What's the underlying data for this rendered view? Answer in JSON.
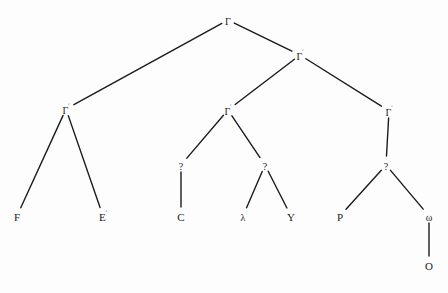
{
  "figure": {
    "type": "syntax-tree-diagram",
    "background_color": "#fdfdfd",
    "line_color": "#1b1b1b",
    "text_color": "#1b1b1b"
  },
  "nodes": [
    {
      "id": "n0",
      "label": "Γ",
      "sup": "",
      "x": 228,
      "y": 20,
      "name": "node-root-gamma"
    },
    {
      "id": "n1",
      "label": "Γ",
      "sup": "ʹ",
      "x": 300,
      "y": 55,
      "name": "node-gamma-prime"
    },
    {
      "id": "n2",
      "label": "Γ",
      "sup": "ʹ",
      "x": 66,
      "y": 109,
      "name": "node-gamma-left"
    },
    {
      "id": "n3",
      "label": "Γ",
      "sup": "ʹ",
      "x": 228,
      "y": 110,
      "name": "node-gamma-mid"
    },
    {
      "id": "n4",
      "label": "Γ",
      "sup": "ʹ",
      "x": 389,
      "y": 111,
      "name": "node-gamma-right"
    },
    {
      "id": "n5",
      "label": "F",
      "sup": "",
      "x": 17,
      "y": 216,
      "name": "node-leaf-f"
    },
    {
      "id": "n6",
      "label": "E",
      "sup": "ʹ",
      "x": 103,
      "y": 216,
      "name": "node-leaf-e"
    },
    {
      "id": "n7",
      "label": "?",
      "sup": "",
      "x": 181,
      "y": 165,
      "name": "node-question-left"
    },
    {
      "id": "n8",
      "label": "C",
      "sup": "",
      "x": 181,
      "y": 216,
      "name": "node-leaf-c"
    },
    {
      "id": "n9",
      "label": "?",
      "sup": "",
      "x": 265,
      "y": 165,
      "name": "node-question-mid"
    },
    {
      "id": "n10",
      "label": "λ",
      "sup": "",
      "x": 243,
      "y": 216,
      "name": "node-leaf-lambda"
    },
    {
      "id": "n11",
      "label": "Y",
      "sup": "",
      "x": 291,
      "y": 216,
      "name": "node-leaf-y"
    },
    {
      "id": "n12",
      "label": "?",
      "sup": "",
      "x": 386,
      "y": 165,
      "name": "node-question-right"
    },
    {
      "id": "n13",
      "label": "P",
      "sup": "",
      "x": 340,
      "y": 216,
      "name": "node-leaf-p"
    },
    {
      "id": "n14",
      "label": "ω",
      "sup": "",
      "x": 429,
      "y": 216,
      "name": "node-leaf-omega"
    },
    {
      "id": "n15",
      "label": "O",
      "sup": "",
      "x": 429,
      "y": 265,
      "name": "node-leaf-o"
    }
  ],
  "edges": [
    {
      "from": "n0",
      "to": "n2",
      "name": "edge-root-to-gamma-left"
    },
    {
      "from": "n0",
      "to": "n1",
      "name": "edge-root-to-gamma-prime"
    },
    {
      "from": "n1",
      "to": "n3",
      "name": "edge-gamma-prime-to-gamma-mid"
    },
    {
      "from": "n1",
      "to": "n4",
      "name": "edge-gamma-prime-to-gamma-right"
    },
    {
      "from": "n2",
      "to": "n5",
      "name": "edge-gamma-left-to-f"
    },
    {
      "from": "n2",
      "to": "n6",
      "name": "edge-gamma-left-to-e"
    },
    {
      "from": "n3",
      "to": "n7",
      "name": "edge-gamma-mid-to-question-left"
    },
    {
      "from": "n3",
      "to": "n9",
      "name": "edge-gamma-mid-to-question-mid"
    },
    {
      "from": "n7",
      "to": "n8",
      "name": "edge-question-left-to-c"
    },
    {
      "from": "n9",
      "to": "n10",
      "name": "edge-question-mid-to-lambda"
    },
    {
      "from": "n9",
      "to": "n11",
      "name": "edge-question-mid-to-y"
    },
    {
      "from": "n4",
      "to": "n12",
      "name": "edge-gamma-right-to-question-right"
    },
    {
      "from": "n12",
      "to": "n13",
      "name": "edge-question-right-to-p"
    },
    {
      "from": "n12",
      "to": "n14",
      "name": "edge-question-right-to-omega"
    },
    {
      "from": "n14",
      "to": "n15",
      "name": "edge-omega-to-o"
    }
  ]
}
